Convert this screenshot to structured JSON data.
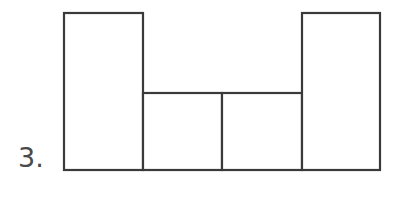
{
  "figure": {
    "item_number": "3.",
    "stroke_color": "#3a3a3a",
    "fill_color": "#ffffff",
    "background_color": "#ffffff",
    "label_color": "#4a4a4a"
  },
  "chart_data": {
    "type": "bar",
    "title": "",
    "xlabel": "",
    "ylabel": "",
    "categories": [
      "1",
      "2",
      "3",
      "4"
    ],
    "values": [
      157,
      77,
      77,
      157
    ],
    "ylim": [
      0,
      157
    ],
    "grid": false,
    "legend": null,
    "annotations": [
      "3."
    ],
    "bars": [
      {
        "index": 0,
        "x": 64,
        "width": 79,
        "top": 13,
        "bottom": 170,
        "height": 157,
        "relative_height": "tall"
      },
      {
        "index": 1,
        "x": 143,
        "width": 79,
        "top": 93,
        "bottom": 170,
        "height": 77,
        "relative_height": "short"
      },
      {
        "index": 2,
        "x": 222,
        "width": 80,
        "top": 93,
        "bottom": 170,
        "height": 77,
        "relative_height": "short"
      },
      {
        "index": 3,
        "x": 302,
        "width": 78,
        "top": 13,
        "bottom": 170,
        "height": 157,
        "relative_height": "tall"
      }
    ]
  }
}
